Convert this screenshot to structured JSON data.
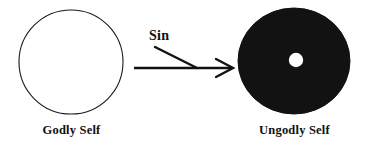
{
  "figure": {
    "type": "concept-diagram",
    "background_color": "#ffffff",
    "nodes": [
      {
        "id": "godly-self",
        "label": "Godly Self",
        "shape": "circle-outline",
        "fill_color": "#ffffff",
        "stroke_color": "#1a1a1a",
        "center_x": 71,
        "center_y": 62,
        "radius_x": 52,
        "radius_y": 52
      },
      {
        "id": "ungodly-self",
        "label": "Ungodly Self",
        "shape": "disc-filled-with-hole",
        "fill_color": "#121212",
        "hole_color": "#ffffff",
        "center_x": 294,
        "center_y": 61,
        "radius_x": 56,
        "radius_y": 53,
        "hole_center_x": 296,
        "hole_center_y": 60,
        "hole_radius": 7
      }
    ],
    "connector": {
      "id": "sin-arrow",
      "label": "Sin",
      "style": "horizontal-shaft-with-open-arrowhead",
      "color": "#111111",
      "shaft_from_x": 134,
      "shaft_to_x": 232,
      "shaft_y": 68,
      "leader_from_x": 155,
      "leader_from_y": 48,
      "leader_to_x": 196,
      "leader_to_y": 68
    }
  }
}
